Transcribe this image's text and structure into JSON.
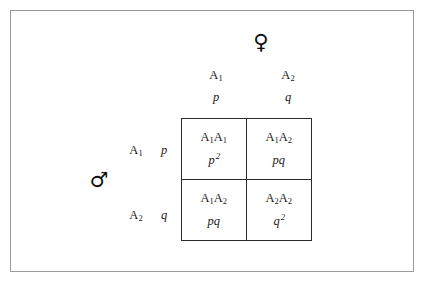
{
  "figure": {
    "background_color": "#ffffff",
    "frame_color": "#9a9a9a",
    "grid_color": "#2b2b2b"
  },
  "parents": {
    "female_symbol": "♀",
    "female_symbol_name": "venus-symbol",
    "male_symbol": "♂",
    "male_symbol_name": "mars-symbol"
  },
  "columns": [
    {
      "allele": "A",
      "allele_subscript": "1",
      "frequency": "p"
    },
    {
      "allele": "A",
      "allele_subscript": "2",
      "frequency": "q"
    }
  ],
  "rows": [
    {
      "allele": "A",
      "allele_subscript": "1",
      "frequency": "p"
    },
    {
      "allele": "A",
      "allele_subscript": "2",
      "frequency": "q"
    }
  ],
  "cells": [
    [
      {
        "genotype_allele_1": "A",
        "genotype_sub_1": "1",
        "genotype_allele_2": "A",
        "genotype_sub_2": "1",
        "frequency_base": "p",
        "frequency_exponent": "2"
      },
      {
        "genotype_allele_1": "A",
        "genotype_sub_1": "1",
        "genotype_allele_2": "A",
        "genotype_sub_2": "2",
        "frequency_base": "pq",
        "frequency_exponent": ""
      }
    ],
    [
      {
        "genotype_allele_1": "A",
        "genotype_sub_1": "1",
        "genotype_allele_2": "A",
        "genotype_sub_2": "2",
        "frequency_base": "pq",
        "frequency_exponent": ""
      },
      {
        "genotype_allele_1": "A",
        "genotype_sub_1": "2",
        "genotype_allele_2": "A",
        "genotype_sub_2": "2",
        "frequency_base": "q",
        "frequency_exponent": "2"
      }
    ]
  ]
}
